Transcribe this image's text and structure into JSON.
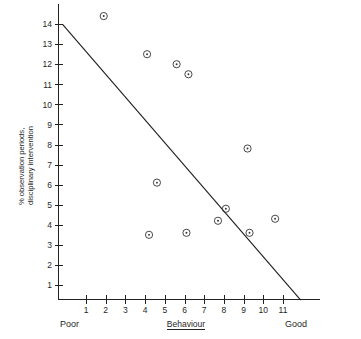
{
  "chart_data": {
    "type": "scatter",
    "title": "",
    "xlabel": "Behaviour",
    "ylabel": "% observation periods, disciplinary intervention",
    "xlim": [
      0,
      12
    ],
    "ylim": [
      0,
      14.8
    ],
    "xticks": [
      1,
      2,
      3,
      4,
      5,
      6,
      7,
      8,
      9,
      10,
      11
    ],
    "yticks": [
      1,
      2,
      3,
      4,
      5,
      6,
      7,
      8,
      9,
      10,
      11,
      12,
      13,
      14
    ],
    "grid": false,
    "legend": null,
    "x_axis_anchor_low": "Poor",
    "x_axis_anchor_high": "Good",
    "marker_style": "circle-with-center-dot",
    "points": [
      {
        "x": 1.9,
        "y": 14.4
      },
      {
        "x": 4.1,
        "y": 12.5
      },
      {
        "x": 5.6,
        "y": 12.0
      },
      {
        "x": 6.2,
        "y": 11.5
      },
      {
        "x": 4.6,
        "y": 6.1
      },
      {
        "x": 9.2,
        "y": 7.8
      },
      {
        "x": 8.1,
        "y": 4.8
      },
      {
        "x": 7.7,
        "y": 4.2
      },
      {
        "x": 10.6,
        "y": 4.3
      },
      {
        "x": 9.3,
        "y": 3.6
      },
      {
        "x": 4.2,
        "y": 3.5
      },
      {
        "x": 6.1,
        "y": 3.6
      }
    ],
    "trend_line": {
      "x1": -0.2,
      "y1": 14.0,
      "x2": 11.9,
      "y2": 0.25
    },
    "colors": {
      "axis": "#222222",
      "marker": "#333333",
      "trend": "#222222",
      "background": "#ffffff"
    }
  }
}
